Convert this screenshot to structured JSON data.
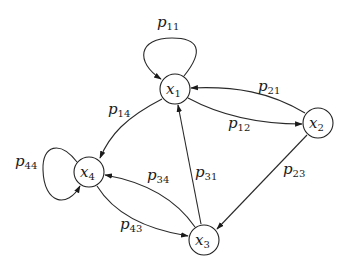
{
  "diagram": {
    "type": "markov-chain-state-diagram",
    "nodes": [
      {
        "id": "x1",
        "base": "x",
        "sub": "1",
        "cx": 175,
        "cy": 89
      },
      {
        "id": "x2",
        "base": "x",
        "sub": "2",
        "cx": 318,
        "cy": 123
      },
      {
        "id": "x3",
        "base": "x",
        "sub": "3",
        "cx": 204,
        "cy": 240
      },
      {
        "id": "x4",
        "base": "x",
        "sub": "4",
        "cx": 89,
        "cy": 172
      }
    ],
    "edges": [
      {
        "id": "p11",
        "from": "x1",
        "to": "x1",
        "base": "p",
        "sub": "11"
      },
      {
        "id": "p12",
        "from": "x1",
        "to": "x2",
        "base": "p",
        "sub": "12"
      },
      {
        "id": "p21",
        "from": "x2",
        "to": "x1",
        "base": "p",
        "sub": "21"
      },
      {
        "id": "p14",
        "from": "x1",
        "to": "x4",
        "base": "p",
        "sub": "14"
      },
      {
        "id": "p23",
        "from": "x2",
        "to": "x3",
        "base": "p",
        "sub": "23"
      },
      {
        "id": "p31",
        "from": "x3",
        "to": "x1",
        "base": "p",
        "sub": "31"
      },
      {
        "id": "p34",
        "from": "x3",
        "to": "x4",
        "base": "p",
        "sub": "34"
      },
      {
        "id": "p43",
        "from": "x4",
        "to": "x3",
        "base": "p",
        "sub": "43"
      },
      {
        "id": "p44",
        "from": "x4",
        "to": "x4",
        "base": "p",
        "sub": "44"
      }
    ]
  }
}
